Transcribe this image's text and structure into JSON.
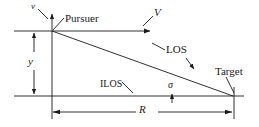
{
  "figure": {
    "type": "diagram",
    "background_color": "#ffffff",
    "line_color": "#1a1a1a",
    "width": 259,
    "height": 127
  },
  "labels": {
    "v_small": "v",
    "pursuer": "Pursuer",
    "V_big": "V",
    "los": "LOS",
    "target": "Target",
    "ilos": "ILOS",
    "sigma": "σ",
    "y": "y",
    "R": "R"
  },
  "geometry": {
    "origin": {
      "x": 52,
      "y": 31,
      "name": "pursuer-point"
    },
    "target_point": {
      "x": 232,
      "y": 96,
      "name": "target-point"
    },
    "ilos_line_y": 96,
    "dimension_line_R_y": 112,
    "dimension_line_y_x": 34,
    "vertical_axis_top_y": 12,
    "velocity_arrow_end_x": 152,
    "los_angle_label": "σ"
  },
  "elements": [
    {
      "name": "vertical-velocity-axis",
      "label": "v"
    },
    {
      "name": "pursuer-marker",
      "label": "Pursuer"
    },
    {
      "name": "velocity-vector",
      "label": "V"
    },
    {
      "name": "line-of-sight",
      "label": "LOS"
    },
    {
      "name": "target-marker",
      "label": "Target"
    },
    {
      "name": "initial-line-of-sight",
      "label": "ILOS"
    },
    {
      "name": "sigma-angle",
      "label": "σ"
    },
    {
      "name": "y-dimension",
      "label": "y"
    },
    {
      "name": "R-dimension",
      "label": "R"
    }
  ]
}
